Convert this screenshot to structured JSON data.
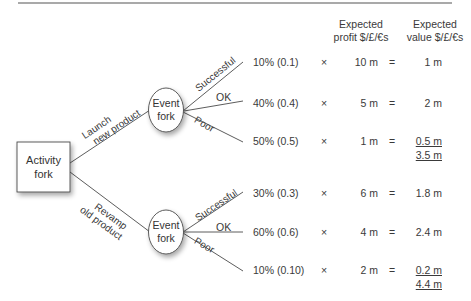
{
  "headers": {
    "expected_profit": [
      "Expected",
      "profit $/£/€s"
    ],
    "expected_value": [
      "Expected",
      "value $/£/€s"
    ]
  },
  "activity": {
    "label": [
      "Activity",
      "fork"
    ]
  },
  "options": [
    {
      "label": [
        "Launch",
        "new product"
      ],
      "event": {
        "label": [
          "Event",
          "fork"
        ]
      },
      "outcomes": [
        {
          "name": "Successful",
          "probability": "10% (0.1)",
          "times": "×",
          "profit": "10 m",
          "equals": "=",
          "value": "1 m"
        },
        {
          "name": "OK",
          "probability": "40% (0.4)",
          "times": "×",
          "profit": "5 m",
          "equals": "=",
          "value": "2 m"
        },
        {
          "name": "Poor",
          "probability": "50% (0.5)",
          "times": "×",
          "profit": "1 m",
          "equals": "=",
          "value": "0.5 m"
        }
      ],
      "total": "3.5 m"
    },
    {
      "label": [
        "Revamp",
        "old product"
      ],
      "event": {
        "label": [
          "Event",
          "fork"
        ]
      },
      "outcomes": [
        {
          "name": "Successful",
          "probability": "30% (0.3)",
          "times": "×",
          "profit": "6 m",
          "equals": "=",
          "value": "1.8 m"
        },
        {
          "name": "OK",
          "probability": "60% (0.6)",
          "times": "×",
          "profit": "4 m",
          "equals": "=",
          "value": "2.4 m"
        },
        {
          "name": "Poor",
          "probability": "10% (0.10)",
          "times": "×",
          "profit": "2 m",
          "equals": "=",
          "value": "0.2 m"
        }
      ],
      "total": "4.4 m"
    }
  ],
  "colors": {
    "line": "#4a4a4a",
    "rule": "#555555",
    "text": "#3a3a3a"
  }
}
